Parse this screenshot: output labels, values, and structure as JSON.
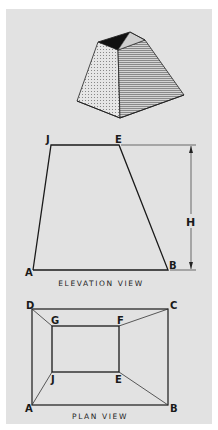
{
  "figure": {
    "background_color": "#e2e2e2",
    "line_color": "#1a1a1a",
    "isometric": {
      "description": "frustum of a rectangular pyramid (open top)"
    },
    "elevation_view": {
      "caption": "ELEVATION VIEW",
      "vertices": {
        "J": "J",
        "E": "E",
        "A": "A",
        "B": "B"
      },
      "dimension_label": "H"
    },
    "plan_view": {
      "caption": "PLAN VIEW",
      "vertices": {
        "A": "A",
        "B": "B",
        "C": "C",
        "D": "D",
        "E": "E",
        "F": "F",
        "G": "G",
        "J": "J"
      }
    }
  }
}
